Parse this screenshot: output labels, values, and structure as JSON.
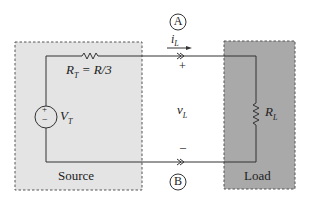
{
  "diagram": {
    "type": "circuit",
    "colors": {
      "source_fill": "#e4e4e4",
      "load_fill": "#a9a9a9",
      "wire": "#333333",
      "text": "#222222",
      "box_border": "#555555"
    },
    "source_box": {
      "label": "Source"
    },
    "load_box": {
      "label": "Load"
    },
    "components": {
      "thevenin_resistor": {
        "symbol": "R",
        "subscript": "T",
        "equation": " = R/3"
      },
      "voltage_source": {
        "symbol": "V",
        "subscript": "T",
        "plus": "+",
        "minus": "−"
      },
      "load_resistor": {
        "symbol": "R",
        "subscript": "L"
      }
    },
    "terminals": {
      "A": {
        "label": "A"
      },
      "B": {
        "label": "B"
      }
    },
    "current": {
      "symbol": "i",
      "subscript": "L"
    },
    "voltage": {
      "symbol": "v",
      "subscript": "L",
      "plus": "+",
      "minus": "–"
    }
  }
}
